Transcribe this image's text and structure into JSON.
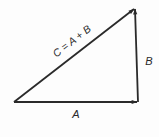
{
  "diagram": {
    "type": "vector-addition-triangle",
    "colors": {
      "stroke": "#2a2a2a",
      "background": "#fdfdfd"
    },
    "vertices": {
      "origin": [
        14,
        102
      ],
      "corner": [
        138,
        102
      ],
      "tip": [
        135,
        8
      ]
    },
    "vectors": [
      {
        "id": "A",
        "label": "A",
        "from": "origin",
        "to": "corner"
      },
      {
        "id": "B",
        "label": "B",
        "from": "corner",
        "to": "tip"
      },
      {
        "id": "C",
        "label": "C = A + B",
        "from": "origin",
        "to": "tip"
      }
    ]
  }
}
